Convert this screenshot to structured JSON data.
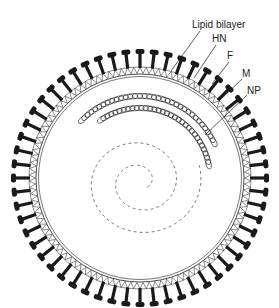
{
  "figure": {
    "center": [
      140,
      178
    ],
    "membrane_radius": 104,
    "spike_count": 56,
    "colors": {
      "ink": "#1a1a1a",
      "background": "#ffffff"
    }
  },
  "labels": [
    {
      "id": "lipid-bilayer",
      "text": "Lipid bilayer",
      "x": 192,
      "y": 20,
      "line": [
        [
          200,
          31
        ],
        [
          171,
          71
        ]
      ]
    },
    {
      "id": "hn",
      "text": "HN",
      "x": 212,
      "y": 34,
      "line": [
        [
          216,
          45
        ],
        [
          194,
          78
        ]
      ]
    },
    {
      "id": "f",
      "text": "F",
      "x": 227,
      "y": 51,
      "line": [
        [
          229,
          62
        ],
        [
          212,
          84
        ]
      ]
    },
    {
      "id": "m",
      "text": "M",
      "x": 242,
      "y": 69,
      "line": [
        [
          242,
          79
        ],
        [
          219,
          101
        ]
      ]
    },
    {
      "id": "np",
      "text": "NP",
      "x": 247,
      "y": 86,
      "line": [
        [
          247,
          95
        ],
        [
          205,
          135
        ]
      ]
    }
  ]
}
